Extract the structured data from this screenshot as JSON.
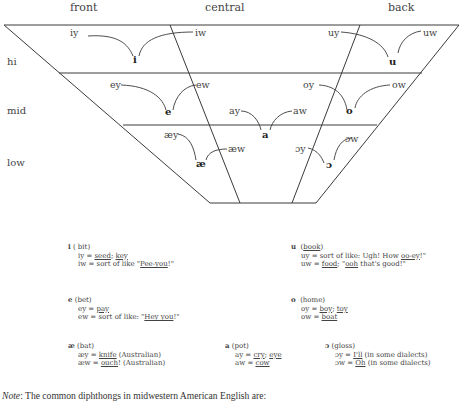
{
  "columns": {
    "front": "front",
    "central": "central",
    "back": "back"
  },
  "rows": {
    "hi": "hi",
    "mid": "mid",
    "low": "low"
  },
  "vowels": {
    "i": {
      "symbol": "i",
      "y_glide": "iy",
      "w_glide": "iw"
    },
    "u": {
      "symbol": "u",
      "y_glide": "uy",
      "w_glide": "uw"
    },
    "e": {
      "symbol": "e",
      "y_glide": "ey",
      "w_glide": "ew"
    },
    "o": {
      "symbol": "o",
      "y_glide": "oy",
      "w_glide": "ow"
    },
    "a": {
      "symbol": "a",
      "y_glide": "ay",
      "w_glide": "aw"
    },
    "ae": {
      "symbol": "æ",
      "y_glide": "æy",
      "w_glide": "æw"
    },
    "oo": {
      "symbol": "ɔ",
      "y_glide": "ɔy",
      "w_glide": "ɔw"
    }
  },
  "legend": {
    "i": {
      "symbol": "i",
      "example": "( bit)",
      "y_line_pre": "iy = ",
      "y_line_u1": "seed",
      "y_line_mid": "; ",
      "y_line_u2": "key",
      "w_line_pre": "iw = sort of like \"",
      "w_line_u": "Pee-you",
      "w_line_post": "!\""
    },
    "u": {
      "symbol": "u",
      "example_pre": "(",
      "example_u": "book",
      "example_post": ")",
      "y_line_pre": "uy = sort of like: Ugh! How ",
      "y_line_u": "oo-ey",
      "y_line_post": "!\"",
      "w_line_pre": "uw = ",
      "w_line_u1": "food",
      "w_line_mid": "; \"",
      "w_line_u2": "ooh",
      "w_line_post": " that's good!\""
    },
    "e": {
      "symbol": "e",
      "example": " (bet)",
      "y_line_pre": "ey = ",
      "y_line_u": "pay",
      "w_line_pre": "ew = sort of like: \"",
      "w_line_u": "Hey you",
      "w_line_post": "!\""
    },
    "o": {
      "symbol": "o",
      "example": "(home)",
      "y_line_pre": "oy = ",
      "y_line_u1": "boy",
      "y_line_mid": "; ",
      "y_line_u2": "toy",
      "w_line_pre": "ow = ",
      "w_line_u": "boat"
    },
    "ae": {
      "symbol": "æ",
      "example": " (bat)",
      "y_line_pre": "æy = ",
      "y_line_u": "knife",
      "y_line_post": " (Australian)",
      "w_line_pre": "æw = ",
      "w_line_u": "ouch",
      "w_line_post": "! (Australian)"
    },
    "a": {
      "symbol": "a",
      "example": " (pot)",
      "y_line_pre": "ay = ",
      "y_line_u1": "cry",
      "y_line_mid": "; ",
      "y_line_u2": "eye",
      "w_line_pre": "aw = ",
      "w_line_u": "cow"
    },
    "oo": {
      "symbol": "ɔ",
      "example": " (gloss)",
      "y_line_pre": "ɔy = ",
      "y_line_u": "I'll",
      "y_line_post": " (in some dialects)",
      "w_line_pre": "ɔw = ",
      "w_line_u": "Oh",
      "w_line_post": " (in some dialects)"
    }
  },
  "note": {
    "label": "Note",
    "text": ": The common diphthongs in midwestern American English are:"
  }
}
